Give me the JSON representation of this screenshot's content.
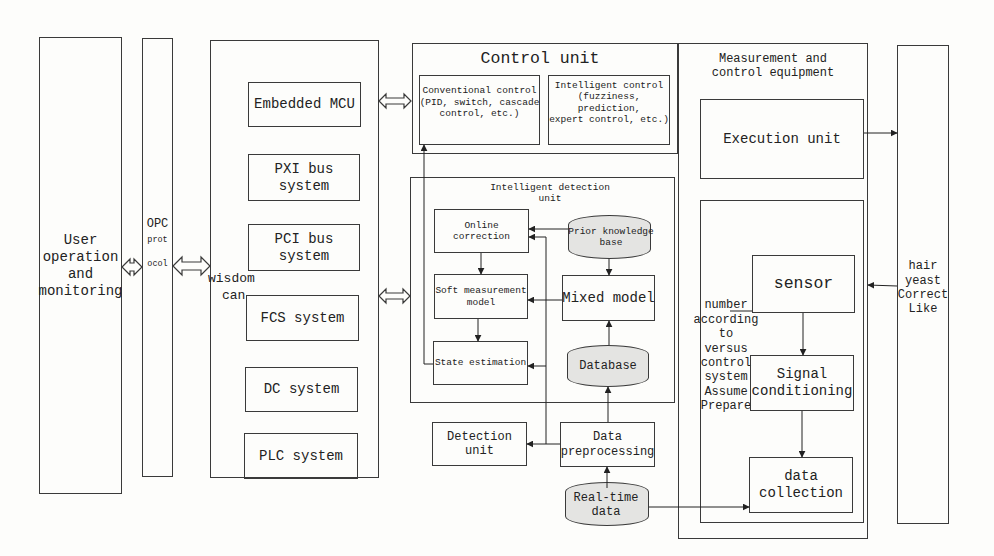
{
  "left": {
    "user_box": "User\noperation\nand\nmonitoring",
    "opc_box": {
      "line1": "OPC",
      "line2": "prot",
      "line3": "ocol"
    },
    "wisdom_label": {
      "line1": "wisdom",
      "line2": "can"
    }
  },
  "systems": [
    {
      "label": "Embedded MCU"
    },
    {
      "label": "PXI bus\nsystem"
    },
    {
      "label": "PCI bus\nsystem"
    },
    {
      "label": "FCS system"
    },
    {
      "label": "DC system"
    },
    {
      "label": "PLC system"
    }
  ],
  "control_unit": {
    "title": "Control unit",
    "conventional": "Conventional control\n(PID, switch, cascade\ncontrol, etc.)",
    "intelligent": "Intelligent control\n(fuzziness, prediction,\nexpert control, etc.)"
  },
  "detection_unit": {
    "title": "Intelligent detection unit",
    "online_correction": "Online correction",
    "soft_measurement": "Soft measurement\nmodel",
    "state_estimation": "State estimation",
    "prior_knowledge": "Prior knowledge base",
    "mixed_model": "Mixed model",
    "database": "Database"
  },
  "lower": {
    "detection_unit": "Detection unit",
    "data_preprocessing": "Data\npreprocessing",
    "realtime_data": "Real-time data"
  },
  "equipment": {
    "title": "Measurement and\ncontrol equipment",
    "execution_unit": "Execution unit",
    "side_label": "number\naccording\nto\nversus\ncontrol\nsystem\nAssume\nPrepare",
    "sensor": "sensor",
    "signal_conditioning": "Signal\nconditioning",
    "data_collection": "data\ncollection"
  },
  "right_box": "hair\nyeast\nCorrect\nLike",
  "colors": {
    "line": "#3a3a3a",
    "cylinder_fill": "#e4e4e2",
    "background": "#fdfdfb"
  }
}
